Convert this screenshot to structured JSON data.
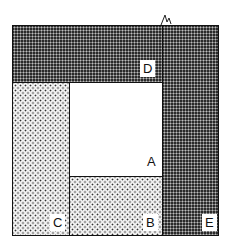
{
  "diagram": {
    "regions": [
      {
        "id": "A",
        "label": "A",
        "fill": "white"
      },
      {
        "id": "B",
        "label": "B",
        "fill": "light-dots"
      },
      {
        "id": "C",
        "label": "C",
        "fill": "light-dots"
      },
      {
        "id": "D",
        "label": "D",
        "fill": "dark-dots"
      },
      {
        "id": "E",
        "label": "E",
        "fill": "dark-dots"
      }
    ],
    "colors": {
      "outline": "#111111",
      "dark_fill": "#2a2a2a",
      "light_fill": "#f4f4f4"
    }
  }
}
